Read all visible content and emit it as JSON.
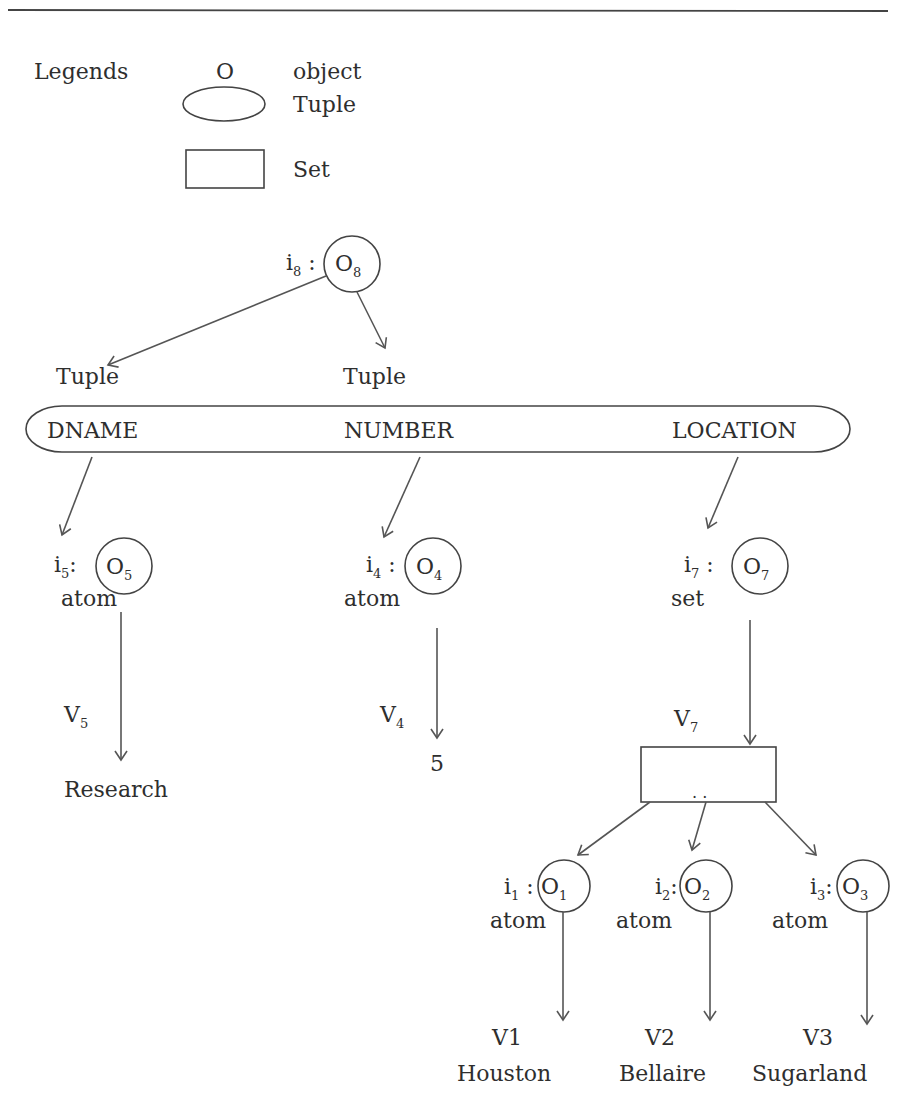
{
  "header_rule": true,
  "legend": {
    "title": "Legends",
    "items": [
      {
        "symbol": "O",
        "shape": "letter",
        "label": "object"
      },
      {
        "symbol": "",
        "shape": "ellipse",
        "label": "Tuple"
      },
      {
        "symbol": "",
        "shape": "rectangle",
        "label": "Set"
      }
    ]
  },
  "root": {
    "id": "i",
    "id_sub": "8",
    "obj": "O",
    "obj_sub": "8"
  },
  "tuple_labels": [
    "Tuple",
    "Tuple"
  ],
  "tuple": {
    "attributes": [
      "DNAME",
      "NUMBER",
      "LOCATION"
    ]
  },
  "nodes": [
    {
      "id": "i",
      "id_sub": "5",
      "obj": "O",
      "obj_sub": "5",
      "type": "atom",
      "value_label": "V",
      "value_sub": "5",
      "value": "Research"
    },
    {
      "id": "i",
      "id_sub": "4",
      "obj": "O",
      "obj_sub": "4",
      "type": "atom",
      "value_label": "V",
      "value_sub": "4",
      "value": "5"
    },
    {
      "id": "i",
      "id_sub": "7",
      "obj": "O",
      "obj_sub": "7",
      "type": "set",
      "value_label": "V",
      "value_sub": "7",
      "value": ""
    }
  ],
  "set_box": {
    "dots": ". ."
  },
  "set_members": [
    {
      "id": "i",
      "id_sub": "1",
      "obj": "O",
      "obj_sub": "1",
      "type": "atom",
      "value_label": "V1",
      "value": "Houston"
    },
    {
      "id": "i",
      "id_sub": "2",
      "obj": "O",
      "obj_sub": "2",
      "type": "atom",
      "value_label": "V2",
      "value": "Bellaire"
    },
    {
      "id": "i",
      "id_sub": "3",
      "obj": "O",
      "obj_sub": "3",
      "type": "atom",
      "value_label": "V3",
      "value": "Sugarland"
    }
  ]
}
